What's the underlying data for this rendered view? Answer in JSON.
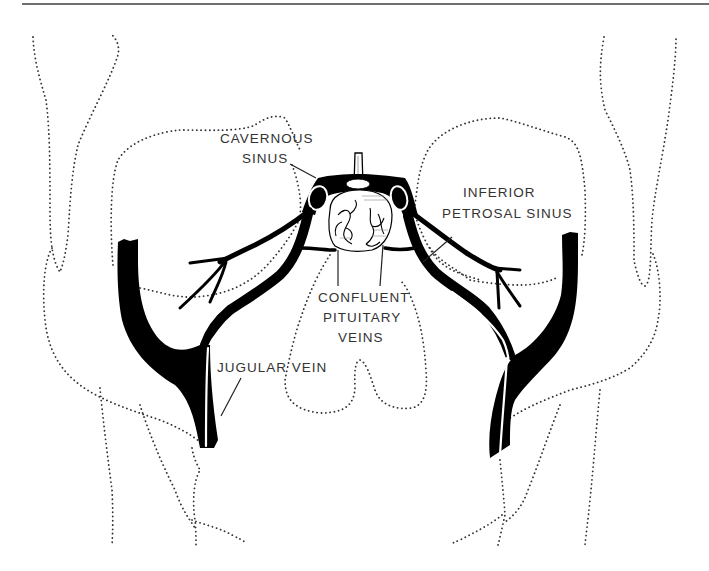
{
  "figure": {
    "type": "anatomical line drawing",
    "colors": {
      "background": "#ffffff",
      "vessels": "#000000",
      "outline_dots": "#333333",
      "label_text": "#333333",
      "top_rule": "#6e6e6e"
    }
  },
  "labels": {
    "cavernous_sinus": {
      "line1": "CAVERNOUS",
      "line2": "SINUS"
    },
    "inferior_petrosal_sinus": {
      "line1": "INFERIOR",
      "line2": "PETROSAL SINUS"
    },
    "confluent_pituitary_veins": {
      "line1": "CONFLUENT",
      "line2": "PITUITARY",
      "line3": "VEINS"
    },
    "jugular_vein": {
      "line1": "JUGULAR VEIN"
    }
  }
}
